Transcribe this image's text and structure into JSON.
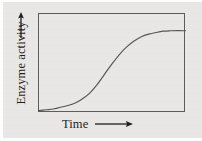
{
  "figure": {
    "background_color": "#e9e8e6",
    "frame_color": "#5b5b5b",
    "curve_color": "#555555",
    "text_color": "#1d1d1d"
  },
  "axes": {
    "y": {
      "label": "Enzyme activity",
      "arrow": "up-arrow-icon",
      "arrow_direction": "up"
    },
    "x": {
      "label": "Time",
      "arrow": "right-arrow-icon",
      "arrow_direction": "right"
    }
  },
  "chart_data": {
    "type": "line",
    "title": "",
    "subtitle": "",
    "xlabel": "Time",
    "ylabel": "Enzyme activity",
    "grid": false,
    "legend": null,
    "axis_ticks": {
      "x": [],
      "y": []
    },
    "xlim": [
      0,
      1
    ],
    "ylim": [
      0,
      1
    ],
    "annotations": [],
    "series": [
      {
        "name": "Enzyme activity",
        "x": [
          0.0,
          0.05,
          0.1,
          0.15,
          0.2,
          0.25,
          0.3,
          0.35,
          0.4,
          0.45,
          0.5,
          0.55,
          0.6,
          0.65,
          0.7,
          0.75,
          0.8,
          0.85,
          0.9,
          0.95,
          1.0
        ],
        "y": [
          0.01,
          0.02,
          0.03,
          0.05,
          0.07,
          0.1,
          0.15,
          0.22,
          0.32,
          0.44,
          0.56,
          0.67,
          0.76,
          0.83,
          0.88,
          0.91,
          0.93,
          0.945,
          0.95,
          0.952,
          0.95
        ]
      }
    ]
  }
}
